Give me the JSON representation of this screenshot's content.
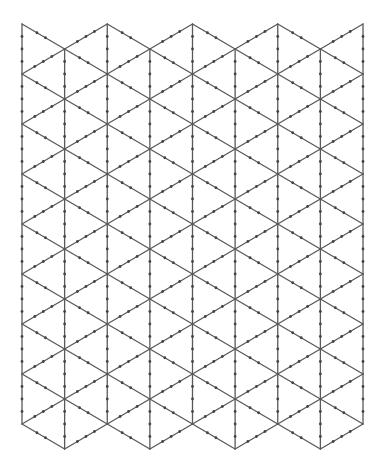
{
  "diagram": {
    "type": "isometric-triangle-grid",
    "canvas": {
      "width": 383,
      "height": 473,
      "background": "#ffffff"
    },
    "origin": {
      "x": 22,
      "y": 24
    },
    "columns": 9,
    "rows_per_column": 8,
    "column_spacing": 42.625,
    "row_spacing": 50,
    "line_color": "#595959",
    "line_width": 1.3,
    "dot_color": "#444444",
    "dot_radius": 1.4,
    "dots": {
      "vertical": [
        0.25,
        0.5,
        0.75
      ],
      "rising_diagonal": [
        0.3,
        0.5,
        0.7
      ],
      "falling_diagonal": [
        0.35,
        0.55
      ]
    }
  }
}
